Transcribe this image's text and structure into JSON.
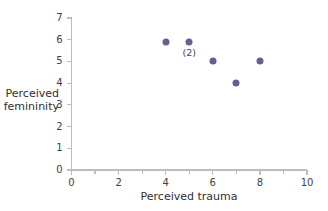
{
  "chart_data": {
    "type": "scatter",
    "title": "",
    "xlabel": "Perceived trauma",
    "ylabel_line1": "Perceived",
    "ylabel_line2": "femininity",
    "xlim": [
      0,
      10
    ],
    "ylim": [
      0,
      7
    ],
    "x_major_ticks": [
      0,
      2,
      4,
      6,
      8,
      10
    ],
    "x_minor_ticks": [
      1,
      3,
      5,
      7,
      9
    ],
    "x_tick_labels": [
      "0",
      "2",
      "4",
      "6",
      "8",
      "10"
    ],
    "y_ticks": [
      0,
      1,
      2,
      3,
      4,
      5,
      6,
      7
    ],
    "y_tick_labels": [
      "0",
      "1",
      "2",
      "3",
      "4",
      "5",
      "6",
      "7"
    ],
    "grid": false,
    "legend": "none",
    "marker_color": "#6B5B8E",
    "axis_color": "#bdbdbd",
    "points": [
      {
        "x": 4,
        "y": 5.9,
        "count": 1,
        "label": ""
      },
      {
        "x": 5,
        "y": 5.9,
        "count": 2,
        "label": "(2)"
      },
      {
        "x": 6,
        "y": 5.0,
        "count": 1,
        "label": ""
      },
      {
        "x": 7,
        "y": 4.0,
        "count": 1,
        "label": ""
      },
      {
        "x": 8,
        "y": 5.0,
        "count": 1,
        "label": ""
      }
    ],
    "total_observations": 6,
    "annotations": [
      {
        "text": "(2)",
        "x": 5,
        "y": 5.9,
        "note": "two overlapping observations"
      }
    ]
  }
}
